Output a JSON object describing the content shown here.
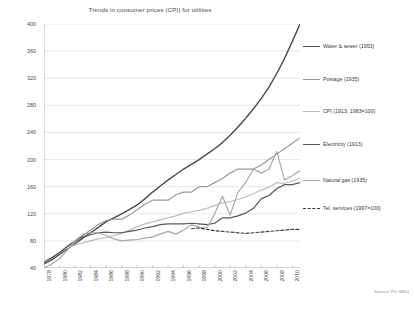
{
  "chart_data": {
    "type": "line",
    "title": "Trends in consumer prices (CPI) for utilities",
    "xlabel": "",
    "ylabel": "",
    "grid": true,
    "legend_position": "right",
    "xlim": [
      1978,
      2011
    ],
    "ylim": [
      40,
      400
    ],
    "yticks": [
      400,
      360,
      320,
      280,
      240,
      200,
      160,
      120,
      80,
      40
    ],
    "xticks": [
      1978,
      1980,
      1982,
      1984,
      1986,
      1988,
      1990,
      1992,
      1994,
      1996,
      1998,
      2000,
      2002,
      2004,
      2006,
      2008,
      2010
    ],
    "x": [
      1978,
      1979,
      1980,
      1981,
      1982,
      1983,
      1984,
      1985,
      1986,
      1987,
      1988,
      1989,
      1990,
      1991,
      1992,
      1993,
      1994,
      1995,
      1996,
      1997,
      1998,
      1999,
      2000,
      2001,
      2002,
      2003,
      2004,
      2005,
      2006,
      2007,
      2008,
      2009,
      2010,
      2011
    ],
    "series": [
      {
        "name": "Water & sewer (1953)",
        "color": "#4a4a4a",
        "width": 1.4,
        "dash": "none",
        "values": [
          46,
          52,
          60,
          68,
          76,
          84,
          92,
          100,
          108,
          114,
          120,
          126,
          133,
          142,
          152,
          161,
          170,
          178,
          186,
          193,
          200,
          208,
          216,
          225,
          236,
          248,
          261,
          275,
          290,
          307,
          327,
          349,
          374,
          400
        ]
      },
      {
        "name": "Postage (1935)",
        "color": "#9a9a9a",
        "width": 1.2,
        "dash": "none",
        "values": [
          48,
          54,
          62,
          70,
          78,
          88,
          96,
          104,
          110,
          112,
          112,
          118,
          126,
          134,
          140,
          140,
          140,
          148,
          152,
          152,
          160,
          160,
          166,
          172,
          180,
          186,
          186,
          186,
          192,
          200,
          208,
          216,
          224,
          232
        ]
      },
      {
        "name": "CPI (1913, 1983=100)",
        "color": "#bdbdbd",
        "width": 1.2,
        "dash": "none",
        "values": [
          50,
          56,
          63,
          70,
          74,
          77,
          80,
          83,
          85,
          88,
          91,
          96,
          101,
          105,
          108,
          111,
          114,
          117,
          121,
          123,
          125,
          128,
          132,
          136,
          138,
          141,
          145,
          150,
          155,
          159,
          166,
          165,
          168,
          173
        ]
      },
      {
        "name": "Electricity (1913)",
        "color": "#585858",
        "width": 1.2,
        "dash": "none",
        "values": [
          48,
          55,
          63,
          72,
          80,
          86,
          89,
          92,
          93,
          92,
          92,
          94,
          96,
          99,
          101,
          104,
          105,
          105,
          105,
          106,
          105,
          104,
          106,
          114,
          114,
          117,
          121,
          128,
          142,
          147,
          157,
          163,
          163,
          166
        ]
      },
      {
        "name": "Natural gas (1935)",
        "color": "#a8a8a8",
        "width": 1.2,
        "dash": "none",
        "values": [
          40,
          46,
          54,
          66,
          80,
          90,
          92,
          92,
          88,
          83,
          80,
          81,
          82,
          84,
          86,
          90,
          94,
          90,
          96,
          104,
          100,
          99,
          120,
          146,
          118,
          152,
          166,
          186,
          180,
          186,
          212,
          170,
          176,
          184
        ]
      },
      {
        "name": "Tel. services (1997=100)",
        "color": "#3d3d3d",
        "width": 1.1,
        "dash": "3,2",
        "values": [
          null,
          null,
          null,
          null,
          null,
          null,
          null,
          null,
          null,
          null,
          null,
          null,
          null,
          null,
          null,
          null,
          null,
          null,
          null,
          98,
          99,
          97,
          95,
          94,
          93,
          92,
          91,
          92,
          93,
          94,
          95,
          96,
          97,
          97
        ]
      }
    ],
    "source_note": "Source: PU-MSU"
  },
  "legend": {
    "entries": [
      {
        "label": "Water & sewer (1953)",
        "top": 12
      },
      {
        "label": "Postage (1935)",
        "top": 45
      },
      {
        "label": "CPI (1913, 1983=100)",
        "top": 77
      },
      {
        "label": "Electricity (1913)",
        "top": 110
      },
      {
        "label": "Natural gas (1935)",
        "top": 146
      },
      {
        "label": "Tel. services (1997=100)",
        "top": 174
      }
    ]
  }
}
